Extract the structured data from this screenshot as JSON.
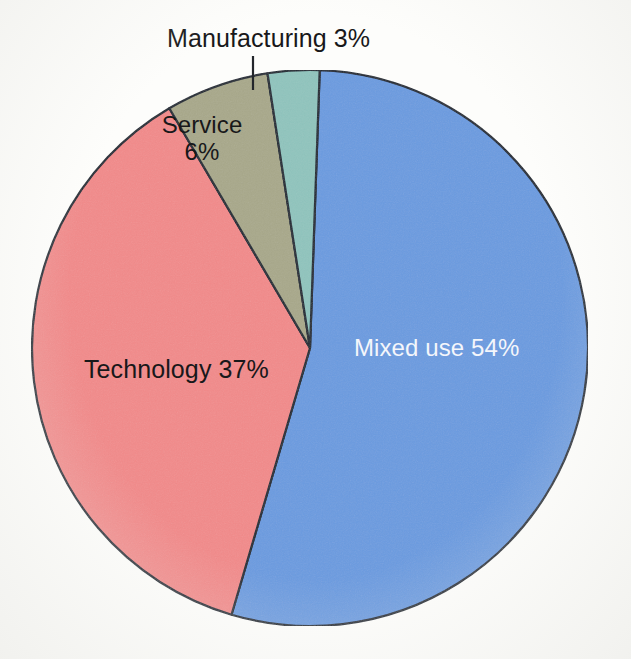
{
  "chart_data": {
    "type": "pie",
    "title": "",
    "subtitle": "",
    "xlabel": "",
    "ylabel": "",
    "legend_position": "none",
    "grid": false,
    "units": "percent",
    "categories": [
      "Mixed use",
      "Technology",
      "Service",
      "Manufacturing"
    ],
    "values": [
      54,
      37,
      6,
      3
    ],
    "slices": [
      {
        "name": "Mixed use",
        "value": 54,
        "label": "Mixed use 54%",
        "value_label": "54%",
        "color": "#6a9be0",
        "label_color": "#f4f6fb",
        "label_placement": "inside",
        "start_angle_deg": 2,
        "end_angle_deg": 196.4
      },
      {
        "name": "Technology",
        "value": 37,
        "label": "Technology 37%",
        "value_label": "37%",
        "color": "#f28a8a",
        "label_color": "#18181a",
        "label_placement": "inside",
        "start_angle_deg": 196.4,
        "end_angle_deg": 329.6
      },
      {
        "name": "Service",
        "value": 6,
        "label": "Service",
        "value_label": "6%",
        "color": "#a8a88a",
        "label_color": "#18181a",
        "label_placement": "inside",
        "start_angle_deg": 329.6,
        "end_angle_deg": 351.2
      },
      {
        "name": "Manufacturing",
        "value": 3,
        "label": "Manufacturing 3%",
        "value_label": "3%",
        "color": "#8fc4bd",
        "label_color": "#18181a",
        "label_placement": "outside-leader",
        "start_angle_deg": 351.2,
        "end_angle_deg": 362
      }
    ]
  },
  "labels": {
    "manufacturing": "Manufacturing 3%",
    "service_name": "Service",
    "service_value": "6%",
    "technology": "Technology 37%",
    "mixed_use": "Mixed use 54%"
  },
  "colors": {
    "mixed_use": "#6a9be0",
    "technology": "#f28a8a",
    "service": "#a8a88a",
    "manufacturing": "#8fc4bd",
    "outline": "#1b2430",
    "leader_line": "#23262b",
    "background": "#fdfdfb",
    "label_dark": "#18181a",
    "label_light": "#f4f6fb"
  },
  "geometry": {
    "center_x": 310,
    "center_y": 348,
    "radius": 278
  }
}
